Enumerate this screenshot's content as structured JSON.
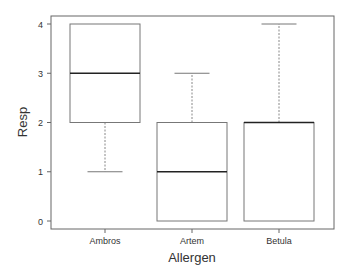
{
  "chart_data": {
    "type": "boxplot",
    "title": "",
    "xlabel": "Allergen",
    "ylabel": "Resp",
    "ylim": [
      0,
      4
    ],
    "yticks": [
      0,
      1,
      2,
      3,
      4
    ],
    "categories": [
      "Ambros",
      "Artem",
      "Betula"
    ],
    "boxes": [
      {
        "name": "Ambros",
        "whisker_low": 1,
        "q1": 2,
        "median": 3,
        "q3": 4,
        "whisker_high": 4
      },
      {
        "name": "Artem",
        "whisker_low": 0,
        "q1": 0,
        "median": 1,
        "q3": 2,
        "whisker_high": 3
      },
      {
        "name": "Betula",
        "whisker_low": 0,
        "q1": 0,
        "median": 2,
        "q3": 2,
        "whisker_high": 4
      }
    ],
    "grid": false,
    "legend": null
  },
  "colors": {
    "frame": "#666666",
    "box": "#777777",
    "median": "#222222",
    "text": "#333333"
  }
}
